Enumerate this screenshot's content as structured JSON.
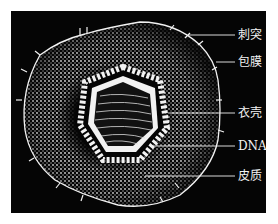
{
  "diagram": {
    "title": "",
    "colors": {
      "background": "#050505",
      "foreground": "#f2f2f2",
      "page": "#ffffff"
    },
    "labels": [
      {
        "id": "spike",
        "text": "刺突",
        "y": 35
      },
      {
        "id": "envelope",
        "text": "包膜",
        "y": 62
      },
      {
        "id": "capsid",
        "text": "衣壳",
        "y": 113
      },
      {
        "id": "dna",
        "text": "DNA",
        "y": 146
      },
      {
        "id": "tegument",
        "text": "皮质",
        "y": 176
      }
    ]
  }
}
